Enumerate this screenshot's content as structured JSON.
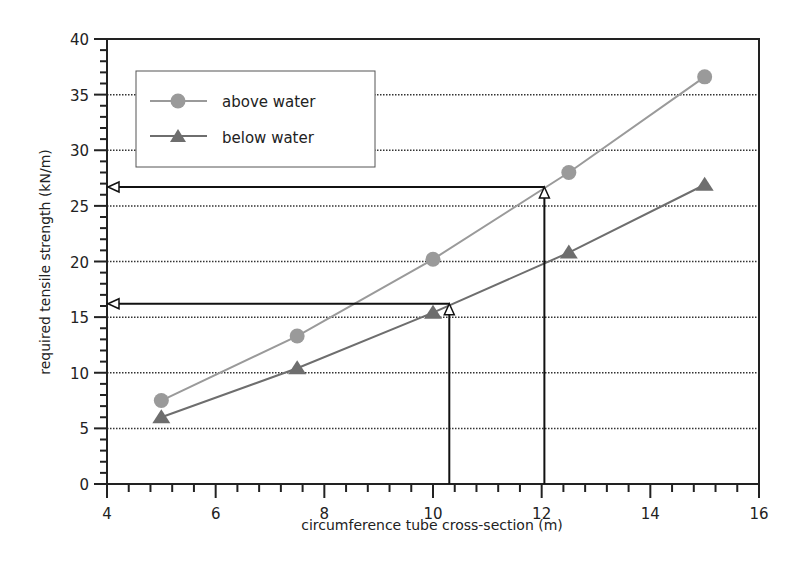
{
  "chart_data": {
    "type": "line",
    "title": "",
    "xlabel": "circumference tube cross-section (m)",
    "ylabel": "required tensile strength (kN/m)",
    "xlim": [
      4,
      16
    ],
    "ylim": [
      0,
      40
    ],
    "x_ticks": [
      4,
      6,
      8,
      10,
      12,
      14,
      16
    ],
    "y_ticks": [
      0,
      5,
      10,
      15,
      20,
      25,
      30,
      35,
      40
    ],
    "grid": {
      "horizontal": true,
      "style": "dotted",
      "vertical": false
    },
    "legend_position": "upper left",
    "x": [
      5,
      7.5,
      10,
      12.5,
      15
    ],
    "series": [
      {
        "name": "above water",
        "marker": "circle",
        "color": "#9a9a9a",
        "values": [
          7.5,
          13.3,
          20.2,
          28.0,
          36.6
        ]
      },
      {
        "name": "below water",
        "marker": "triangle",
        "color": "#6e6e6e",
        "values": [
          6.0,
          10.4,
          15.4,
          20.8,
          26.9
        ]
      }
    ],
    "annotations": [
      {
        "type": "arrow-lookup",
        "x": 12.05,
        "y": 26.7,
        "description": "vertical arrow from x-axis up to above-water curve, horizontal arrow to y-axis"
      },
      {
        "type": "arrow-lookup",
        "x": 10.3,
        "y": 16.2,
        "description": "vertical arrow from x-axis up to below-water curve, horizontal arrow to y-axis"
      }
    ]
  },
  "labels": {
    "x_ticks": [
      "4",
      "6",
      "8",
      "10",
      "12",
      "14",
      "16"
    ],
    "y_ticks": [
      "0",
      "5",
      "10",
      "15",
      "20",
      "25",
      "30",
      "35",
      "40"
    ],
    "legend_above": "above water",
    "legend_below": "below water"
  }
}
